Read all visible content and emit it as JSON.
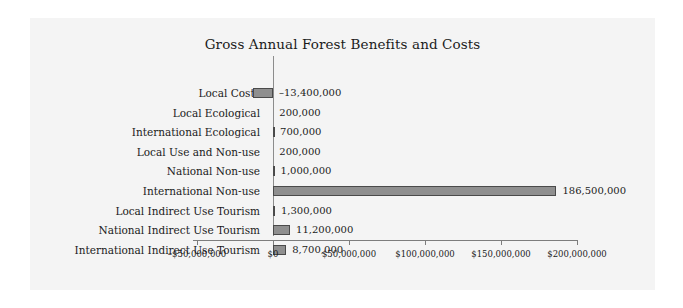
{
  "chart_data": {
    "type": "bar",
    "orientation": "horizontal",
    "title": "Gross Annual Forest Benefits and Costs",
    "xlabel": "",
    "ylabel": "",
    "xlim": [
      -62500000,
      212500000
    ],
    "grid": false,
    "legend": null,
    "categories": [
      "Local Costs",
      "Local Ecological",
      "International Ecological",
      "Local Use and Non-use",
      "National Non-use",
      "International Non-use",
      "Local Indirect Use Tourism",
      "National Indirect Use Tourism",
      "International Indirect Use Tourism"
    ],
    "values": [
      -13400000,
      200000,
      700000,
      200000,
      1000000,
      186500000,
      1300000,
      11200000,
      8700000
    ],
    "value_labels": [
      "–13,400,000",
      "200,000",
      "700,000",
      "200,000",
      "1,000,000",
      "186,500,000",
      "1,300,000",
      "11,200,000",
      "8,700,000"
    ],
    "xticks": [
      -50000000,
      0,
      50000000,
      100000000,
      150000000,
      200000000
    ],
    "xtick_labels": [
      "–$50,000,000",
      "$0",
      "$50,000,000",
      "$100,000,000",
      "$150,000,000",
      "$200,000,000"
    ],
    "bar_color": "#8f8f8f",
    "bar_edge_color": "#4a4a4a",
    "axis_color": "#7d7d7d",
    "background_color": "#f4f4f4",
    "text_color": "#1b1b1b"
  }
}
